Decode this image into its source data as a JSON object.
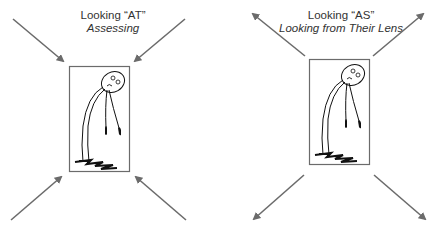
{
  "panels": [
    {
      "title": "Looking “AT”",
      "subtitle": "Assessing",
      "arrow_direction": "inward"
    },
    {
      "title": "Looking “AS”",
      "subtitle": "Looking from Their Lens",
      "arrow_direction": "outward"
    }
  ],
  "colors": {
    "arrow": "#6b6b6b",
    "frame": "#6b6b6b",
    "figure": "#111111",
    "text": "#333333"
  }
}
